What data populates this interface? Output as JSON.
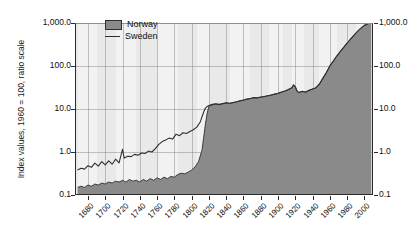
{
  "chart_data": {
    "type": "area",
    "title": "",
    "xlabel": "",
    "ylabel": "Index values, 1960 = 100, ratio scale",
    "scale": "log",
    "grid": true,
    "legend_position": "top-left-inside",
    "xlim": [
      1665,
      2010
    ],
    "ylim": [
      0.1,
      1000
    ],
    "y_ticks": [
      "0.1",
      "1.0",
      "10.0",
      "100.0",
      "1,000.0"
    ],
    "y_tick_values": [
      0.1,
      1.0,
      10.0,
      100.0,
      1000.0
    ],
    "y_axis_both_sides": true,
    "x_ticks": [
      "1680",
      "1700",
      "1720",
      "1740",
      "1760",
      "1780",
      "1800",
      "1820",
      "1840",
      "1860",
      "1880",
      "1900",
      "1920",
      "1940",
      "1960",
      "1980",
      "2000"
    ],
    "x_tick_values": [
      1680,
      1700,
      1720,
      1740,
      1760,
      1780,
      1800,
      1820,
      1840,
      1860,
      1880,
      1900,
      1920,
      1940,
      1960,
      1980,
      2000
    ],
    "colors": {
      "norway_fill": "#8a8a8a",
      "sweden_line": "#2f2f2f",
      "plot_background": "#e9e9e9",
      "band_light": "#f2f2f2",
      "axis": "#2b2b2b",
      "grid": "#9a9a9a"
    },
    "series": [
      {
        "name": "Norway",
        "style": "filled-area",
        "color": "#8a8a8a",
        "x": [
          1668,
          1672,
          1676,
          1680,
          1684,
          1688,
          1692,
          1696,
          1700,
          1704,
          1708,
          1712,
          1716,
          1720,
          1724,
          1728,
          1732,
          1736,
          1740,
          1744,
          1748,
          1752,
          1756,
          1760,
          1764,
          1768,
          1772,
          1776,
          1780,
          1784,
          1788,
          1792,
          1796,
          1800,
          1804,
          1808,
          1812,
          1814,
          1816,
          1818,
          1820,
          1824,
          1828,
          1832,
          1836,
          1840,
          1844,
          1848,
          1852,
          1856,
          1860,
          1864,
          1868,
          1872,
          1876,
          1880,
          1884,
          1888,
          1892,
          1896,
          1900,
          1904,
          1908,
          1912,
          1916,
          1918,
          1920,
          1922,
          1924,
          1928,
          1932,
          1936,
          1940,
          1944,
          1948,
          1952,
          1956,
          1960,
          1964,
          1968,
          1972,
          1976,
          1980,
          1984,
          1988,
          1992,
          1996,
          2000,
          2004,
          2008
        ],
        "y": [
          0.15,
          0.16,
          0.15,
          0.17,
          0.16,
          0.18,
          0.17,
          0.19,
          0.18,
          0.2,
          0.19,
          0.21,
          0.2,
          0.22,
          0.2,
          0.23,
          0.21,
          0.22,
          0.2,
          0.23,
          0.21,
          0.24,
          0.22,
          0.25,
          0.23,
          0.26,
          0.24,
          0.27,
          0.26,
          0.3,
          0.32,
          0.31,
          0.34,
          0.38,
          0.45,
          0.6,
          1.1,
          2.2,
          4.5,
          8.0,
          11.5,
          12.5,
          13.0,
          12.6,
          13.2,
          13.8,
          13.4,
          14.0,
          14.6,
          15.4,
          16.0,
          16.8,
          17.4,
          18.2,
          18.0,
          18.8,
          19.4,
          20.2,
          21.0,
          22.0,
          23.0,
          24.5,
          26.0,
          28.0,
          31.0,
          36.0,
          33.0,
          26.0,
          24.0,
          25.5,
          24.5,
          27.0,
          29.0,
          31.0,
          38.0,
          52.0,
          70.0,
          100.0,
          130.0,
          170.0,
          215.0,
          270.0,
          340.0,
          420.0,
          520.0,
          640.0,
          760.0,
          880.0,
          960.0,
          1000.0
        ]
      },
      {
        "name": "Sweden",
        "style": "line",
        "color": "#2f2f2f",
        "x": [
          1668,
          1672,
          1676,
          1680,
          1684,
          1688,
          1692,
          1696,
          1700,
          1704,
          1708,
          1712,
          1716,
          1720,
          1722,
          1726,
          1730,
          1734,
          1738,
          1742,
          1746,
          1750,
          1754,
          1758,
          1762,
          1766,
          1770,
          1774,
          1778,
          1782,
          1786,
          1790,
          1794,
          1798,
          1802,
          1806,
          1810,
          1814,
          1816,
          1818,
          1820,
          1824,
          1828,
          1832,
          1836,
          1840,
          1844,
          1848,
          1852,
          1856,
          1860,
          1864,
          1868,
          1872,
          1876,
          1880,
          1884,
          1888,
          1892,
          1896,
          1900,
          1904,
          1908,
          1912,
          1916,
          1918,
          1920,
          1922,
          1924,
          1928,
          1932,
          1936,
          1940,
          1944,
          1948,
          1952,
          1956,
          1960,
          1964,
          1968,
          1972,
          1976,
          1980,
          1984,
          1988,
          1992,
          1996,
          2000,
          2004,
          2008
        ],
        "y": [
          0.38,
          0.42,
          0.4,
          0.48,
          0.44,
          0.55,
          0.47,
          0.6,
          0.5,
          0.62,
          0.52,
          0.68,
          0.56,
          1.15,
          0.72,
          0.8,
          0.78,
          0.88,
          0.84,
          0.95,
          0.92,
          1.05,
          1.0,
          1.2,
          1.5,
          1.75,
          1.9,
          2.1,
          2.0,
          2.6,
          2.4,
          2.8,
          2.7,
          3.0,
          3.3,
          3.8,
          5.0,
          8.5,
          10.5,
          11.5,
          12.0,
          12.8,
          13.2,
          12.8,
          13.4,
          14.0,
          13.6,
          14.2,
          14.8,
          15.6,
          16.2,
          17.0,
          17.6,
          18.4,
          18.2,
          19.0,
          19.6,
          20.4,
          21.2,
          22.2,
          23.2,
          24.8,
          26.3,
          28.3,
          31.3,
          36.5,
          33.3,
          26.3,
          24.3,
          25.8,
          24.8,
          27.3,
          29.3,
          31.3,
          38.3,
          52.3,
          70.3,
          100.3,
          130.3,
          170.3,
          215.3,
          270.3,
          340.3,
          420.3,
          520.3,
          640.3,
          760.3,
          880.3,
          960.3,
          1000.3
        ]
      }
    ]
  },
  "legend": {
    "items": [
      {
        "label": "Norway",
        "marker": "filled-swatch"
      },
      {
        "label": "Sweden",
        "marker": "line"
      }
    ]
  }
}
